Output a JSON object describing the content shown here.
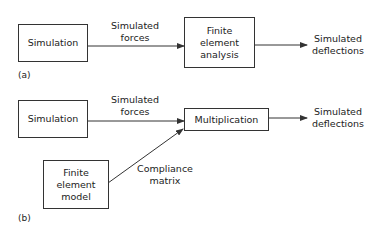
{
  "diagram": {
    "panel_a": {
      "caption": "(a)",
      "nodes": {
        "simulation": {
          "lines": [
            "Simulation"
          ]
        },
        "fea": {
          "lines": [
            "Finite",
            "element",
            "analysis"
          ]
        }
      },
      "edges": {
        "forces": {
          "lines": [
            "Simulated",
            "forces"
          ]
        },
        "output": {
          "lines": [
            "Simulated",
            "deflections"
          ]
        }
      }
    },
    "panel_b": {
      "caption": "(b)",
      "nodes": {
        "simulation": {
          "lines": [
            "Simulation"
          ]
        },
        "multiplication": {
          "lines": [
            "Multiplication"
          ]
        },
        "fe_model": {
          "lines": [
            "Finite",
            "element",
            "model"
          ]
        }
      },
      "edges": {
        "forces": {
          "lines": [
            "Simulated",
            "forces"
          ]
        },
        "compliance": {
          "lines": [
            "Compliance",
            "matrix"
          ]
        },
        "output": {
          "lines": [
            "Simulated",
            "deflections"
          ]
        }
      }
    },
    "colors": {
      "stroke": "#333333",
      "text": "#222222",
      "background": "#ffffff"
    }
  }
}
